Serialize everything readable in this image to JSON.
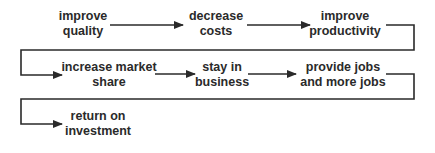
{
  "diagram": {
    "type": "flow-chain",
    "rows": [
      [
        "improve quality",
        "decrease costs",
        "improve productivity"
      ],
      [
        "increase market share",
        "stay in business",
        "provide jobs and more jobs"
      ],
      [
        "return on investment"
      ]
    ],
    "nodes": [
      {
        "id": "improve-quality",
        "line1": "improve",
        "line2": "quality"
      },
      {
        "id": "decrease-costs",
        "line1": "decrease",
        "line2": "costs"
      },
      {
        "id": "improve-productivity",
        "line1": "improve",
        "line2": "productivity"
      },
      {
        "id": "increase-market-share",
        "line1": "increase market",
        "line2": "share"
      },
      {
        "id": "stay-in-business",
        "line1": "stay in",
        "line2": "business"
      },
      {
        "id": "provide-jobs",
        "line1": "provide jobs",
        "line2": "and more jobs"
      },
      {
        "id": "return-on-investment",
        "line1": "return on",
        "line2": "investment"
      }
    ],
    "edges": [
      [
        "improve quality",
        "decrease costs"
      ],
      [
        "decrease costs",
        "improve productivity"
      ],
      [
        "improve productivity",
        "increase market share"
      ],
      [
        "increase market share",
        "stay in business"
      ],
      [
        "stay in business",
        "provide jobs and more jobs"
      ],
      [
        "provide jobs and more jobs",
        "return on investment"
      ]
    ],
    "line_color": "#2a2a2a"
  }
}
